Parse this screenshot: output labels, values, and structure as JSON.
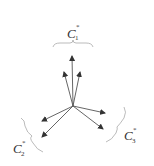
{
  "diagram": {
    "clusters": [
      {
        "id": "c1",
        "label": "C",
        "subscript": "1",
        "superscript": "*",
        "arrow_count": 3,
        "direction": "up"
      },
      {
        "id": "c2",
        "label": "C",
        "subscript": "2",
        "superscript": "*",
        "arrow_count": 2,
        "direction": "lower-left"
      },
      {
        "id": "c3",
        "label": "C",
        "subscript": "3",
        "superscript": "*",
        "arrow_count": 2,
        "direction": "lower-right"
      }
    ],
    "colors": {
      "arrow": "#333333",
      "brace": "#999999",
      "text": "#333333"
    }
  }
}
